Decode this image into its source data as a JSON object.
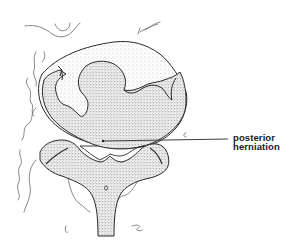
{
  "figure": {
    "annotation": {
      "line1": "posterior",
      "line2": "herniation"
    },
    "colors": {
      "ink": "#2a2a2a",
      "stipple": "#5a5a5a",
      "background": "#ffffff"
    }
  }
}
